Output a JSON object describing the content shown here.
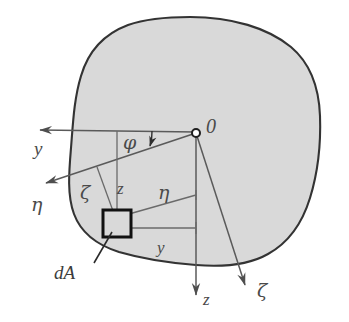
{
  "figure": {
    "colors": {
      "outline": "#333333",
      "fill": "#d9d9d9",
      "axis_line": "#5a5a5a",
      "element_border": "#111111",
      "label": "#4a4a4a",
      "background": "#ffffff"
    }
  },
  "labels": {
    "origin": "0",
    "axis_y": "y",
    "axis_z": "z",
    "axis_eta": "η",
    "axis_zeta": "ζ",
    "angle_phi": "φ",
    "coord_z": "z",
    "coord_y": "y",
    "coord_eta": "η",
    "coord_zeta": "ζ",
    "element_area": "dA"
  },
  "geometry": {
    "origin": {
      "x": 196,
      "y": 133
    },
    "element": {
      "x": 103,
      "y": 210,
      "width": 28,
      "height": 27
    },
    "angle_phi_degrees": 18,
    "axis_y_tip": {
      "x": 33,
      "y": 130
    },
    "axis_eta_tip": {
      "x": 39,
      "y": 186
    },
    "axis_z_tip": {
      "x": 196,
      "y": 301
    },
    "axis_zeta_tip": {
      "x": 249,
      "y": 291
    }
  }
}
